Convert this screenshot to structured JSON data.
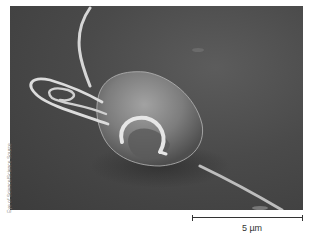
{
  "figure": {
    "credit": "Eye of Science/Science Source",
    "scale_bar": {
      "label": "5 µm"
    },
    "colors": {
      "background": "#ffffff",
      "micrograph_bg": "#4a4a4a",
      "cell": "#8a8a8a",
      "flagella": "#d8d8d8",
      "scale_bar": "#333333"
    }
  }
}
